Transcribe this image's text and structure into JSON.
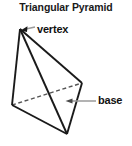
{
  "diagram": {
    "title": "Triangular Pyramid",
    "shape_name": "triangular-pyramid",
    "labels": {
      "vertex": "vertex",
      "base": "base"
    },
    "colors": {
      "background": "#ffffff",
      "outline": "#1a1a1a",
      "base_fill": "#d8d8d8",
      "side_fill": "#ffffff",
      "hidden_edge": "#555555",
      "leader_line": "#999999",
      "text": "#111111"
    },
    "geometry": {
      "apex": [
        20,
        29
      ],
      "base_left": [
        12,
        105
      ],
      "base_right": [
        82,
        83
      ],
      "base_front": [
        67,
        134
      ],
      "hidden_edge": "base_left-base_right"
    },
    "leaders": {
      "vertex": {
        "from": [
          34,
          27
        ],
        "to": [
          22,
          31
        ]
      },
      "base": {
        "from": [
          96,
          101
        ],
        "to": [
          66,
          101
        ]
      }
    }
  }
}
